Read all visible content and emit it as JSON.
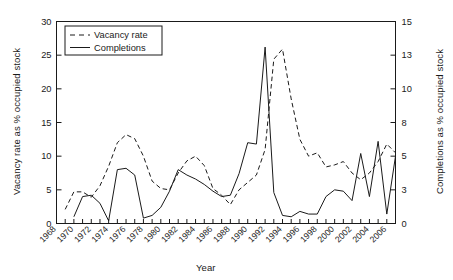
{
  "chart_data": {
    "type": "line",
    "title": "",
    "xlabel": "Year",
    "ylabel": "Vacancy rate as % occupied stock",
    "y2label": "Completions as % occupied stock",
    "xlim": [
      1968,
      2007
    ],
    "ylim": [
      0,
      30
    ],
    "y2lim": [
      0,
      15
    ],
    "grid": false,
    "legend_position": "top-left",
    "x_tick_labels": [
      "1968",
      "1970",
      "1972",
      "1974",
      "1976",
      "1978",
      "1980",
      "1982",
      "1984",
      "1986",
      "1988",
      "1990",
      "1992",
      "1994",
      "1996",
      "1998",
      "2000",
      "2002",
      "2004",
      "2006"
    ],
    "x_tick_label_step": 2,
    "x_minor_tick_step": 1,
    "y_tick_labels": [
      "0",
      "5",
      "10",
      "15",
      "20",
      "25",
      "30"
    ],
    "y2_tick_labels": [
      "0",
      "3",
      "5",
      "8",
      "10",
      "13",
      "15"
    ],
    "y2_tick_values": [
      0,
      2.5,
      5,
      7.5,
      10,
      12.5,
      15
    ],
    "series": [
      {
        "name": "Vacancy rate",
        "axis": "left",
        "style": "dashed",
        "color": "#1a1a1a",
        "x": [
          1969,
          1970,
          1971,
          1972,
          1973,
          1974,
          1975,
          1976,
          1977,
          1978,
          1979,
          1980,
          1981,
          1982,
          1983,
          1984,
          1985,
          1986,
          1987,
          1988,
          1989,
          1990,
          1991,
          1992,
          1993,
          1994,
          1995,
          1996,
          1997,
          1998,
          1999,
          2000,
          2001,
          2002,
          2003,
          2004,
          2005,
          2006,
          2007
        ],
        "y": [
          2.1,
          4.7,
          4.7,
          3.9,
          5.6,
          8.5,
          12.0,
          13.2,
          12.6,
          10.0,
          6.3,
          5.2,
          5.0,
          7.5,
          9.3,
          10.0,
          8.6,
          5.2,
          4.2,
          2.8,
          5.0,
          6.1,
          7.2,
          11.0,
          24.4,
          25.9,
          18.5,
          12.5,
          10.0,
          10.5,
          8.4,
          8.7,
          9.2,
          7.5,
          6.5,
          7.5,
          9.2,
          11.8,
          10.5
        ],
        "y_note": "Values read on left axis (0-30)"
      },
      {
        "name": "Completions",
        "axis": "right",
        "style": "solid",
        "color": "#1a1a1a",
        "x": [
          1970,
          1971,
          1972,
          1973,
          1974,
          1975,
          1976,
          1977,
          1978,
          1979,
          1980,
          1981,
          1982,
          1983,
          1984,
          1985,
          1986,
          1987,
          1988,
          1989,
          1990,
          1991,
          1992,
          1993,
          1994,
          1995,
          1996,
          1997,
          1998,
          1999,
          2000,
          2001,
          2002,
          2003,
          2004,
          2005,
          2006,
          2007
        ],
        "y": [
          0.5,
          2.0,
          2.1,
          1.5,
          0.2,
          4.0,
          4.1,
          3.6,
          0.4,
          0.6,
          1.2,
          2.4,
          4.0,
          3.6,
          3.3,
          2.9,
          2.4,
          2.0,
          2.1,
          3.7,
          6.0,
          5.9,
          13.1,
          2.3,
          0.6,
          0.5,
          0.9,
          0.7,
          0.7,
          2.0,
          2.5,
          2.4,
          1.7,
          5.2,
          2.0,
          6.1,
          0.7,
          5.0
        ],
        "y_note": "Values read on right axis (0-15)"
      }
    ],
    "legend": [
      {
        "label": "Vacancy rate",
        "style": "dashed"
      },
      {
        "label": "Completions",
        "style": "solid"
      }
    ]
  }
}
